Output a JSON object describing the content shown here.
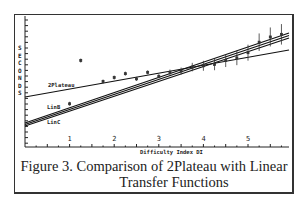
{
  "chart_data": {
    "type": "line",
    "title": "",
    "xlabel": "Difficulty Index DI",
    "ylabel": "SECONDS",
    "x_ticks": [
      "1",
      "2",
      "3",
      "4",
      "5"
    ],
    "xlim": [
      0,
      5.8
    ],
    "y_ticks_labeled": false,
    "grid": false,
    "series": [
      {
        "name": "2Plateau",
        "x": [
          0,
          5.8
        ],
        "y_rel": [
          0.4,
          0.72
        ]
      },
      {
        "name": "LinB",
        "x": [
          0,
          5.8
        ],
        "y_rel": [
          0.2,
          0.83
        ]
      },
      {
        "name": "LinC",
        "x": [
          0,
          5.8
        ],
        "y_rel": [
          0.19,
          0.81
        ]
      },
      {
        "name": "observed",
        "type": "scatter_errorbars",
        "x": [
          1.0,
          1.25,
          1.75,
          2.0,
          2.25,
          2.5,
          2.75,
          3.0,
          3.25,
          3.5,
          3.75,
          4.0,
          4.25,
          4.5,
          4.75,
          5.0,
          5.25,
          5.5,
          5.75
        ],
        "y_rel": [
          0.33,
          0.66,
          0.5,
          0.53,
          0.56,
          0.52,
          0.57,
          0.54,
          0.57,
          0.58,
          0.61,
          0.62,
          0.63,
          0.66,
          0.68,
          0.72,
          0.8,
          0.84,
          0.86
        ]
      }
    ],
    "legend": "inline labels",
    "caption": "Figure 3. Comparison of 2Plateau with Linear Transfer Functions"
  },
  "caption": {
    "line1": "Figure 3. Comparison of 2Plateau with Linear",
    "line2": "Transfer Functions"
  },
  "axis": {
    "ylabel_letters": [
      "S",
      "E",
      "C",
      "O",
      "N",
      "D",
      "S"
    ],
    "xlabel": "Difficulty Index DI",
    "x_ticks": [
      "1",
      "2",
      "3",
      "4",
      "5"
    ]
  },
  "labels": {
    "plateau": "2Plateau",
    "linb": "LinB",
    "linc": "LinC"
  }
}
